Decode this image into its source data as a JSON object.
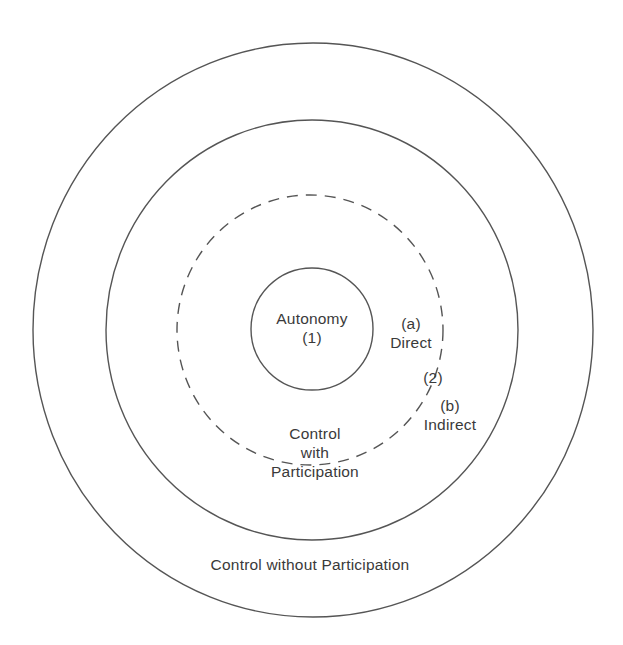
{
  "diagram": {
    "type": "concentric-circles",
    "rings": [
      {
        "id": "outer",
        "style": "solid",
        "label": "Control without Participation"
      },
      {
        "id": "participation",
        "style": "solid",
        "label_lines": [
          "Control",
          "with",
          "Participation"
        ]
      },
      {
        "id": "direct-indirect-boundary",
        "style": "dashed"
      },
      {
        "id": "autonomy",
        "style": "solid",
        "label_lines": [
          "Autonomy",
          "(1)"
        ]
      }
    ],
    "annotations": {
      "a_marker": "(a)",
      "direct": "Direct",
      "two_marker": "(2)",
      "b_marker": "(b)",
      "indirect": "Indirect"
    },
    "colors": {
      "stroke": "#555555",
      "text": "#3a3a3a",
      "background": "#ffffff"
    }
  }
}
